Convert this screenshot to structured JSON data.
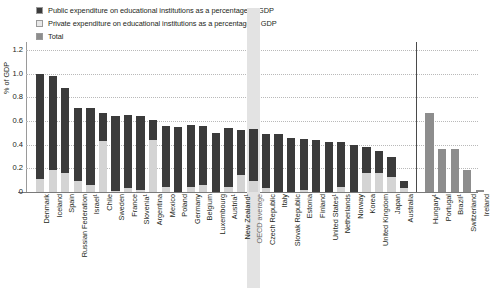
{
  "legend": {
    "items": [
      {
        "label": "Public expenditure on educational institutions as a percentage of GDP",
        "swatch": "dark-gray-swatch",
        "color": "#3b3b3b"
      },
      {
        "label": "Private expenditure on educational institutions as a percentage of GDP",
        "swatch": "light-gray-swatch",
        "color": "#d4d4d4"
      },
      {
        "label": "Total",
        "swatch": "medium-gray-swatch",
        "color": "#8d8d8d"
      }
    ]
  },
  "chart_data": {
    "type": "bar",
    "title": "",
    "subtitle": "",
    "xlabel": "",
    "ylabel": "% of GDP",
    "ylim": [
      0,
      1.2
    ],
    "ytick_labels": [
      "1.2",
      "1.0",
      "0.8",
      "0.6",
      "0.4",
      "0.2",
      "0"
    ],
    "ytick_values": [
      1.2,
      1.0,
      0.8,
      0.6,
      0.4,
      0.2,
      0
    ],
    "grid": true,
    "stacked": true,
    "legend_position": "top-left",
    "highlight_category": "OECD average",
    "panel_divider_after": "Australia",
    "categories": [
      "Denmark",
      "Iceland",
      "Spain",
      "Russian Federation",
      "Israel¹",
      "Chile",
      "Sweden",
      "France",
      "Slovenia¹",
      "Argentina",
      "Mexico",
      "Poland",
      "Germany",
      "Belgium",
      "Luxembourg",
      "Austria¹",
      "New Zealand¹",
      "OECD average",
      "Czech Republic",
      "Italy",
      "Slovak Republic",
      "Estonia",
      "Finland",
      "United States¹",
      "Netherlands",
      "Norway",
      "Korea",
      "United Kingdom",
      "Japan",
      "Australia",
      "Hungary¹",
      "Portugal",
      "Brazil¹",
      "Switzerland",
      "Ireland"
    ],
    "series": [
      {
        "name": "Public expenditure on educational institutions as a percentage of GDP",
        "color": "#3b3b3b",
        "values": [
          0.89,
          0.79,
          0.72,
          0.62,
          0.65,
          0.24,
          0.63,
          0.62,
          0.62,
          0.17,
          0.52,
          0.55,
          0.53,
          0.5,
          0.5,
          0.5,
          0.38,
          0.44,
          0.46,
          0.49,
          0.46,
          0.43,
          0.44,
          0.42,
          0.38,
          0.4,
          0.22,
          0.19,
          0.17,
          0.06,
          null,
          null,
          null,
          null,
          null
        ]
      },
      {
        "name": "Private expenditure on educational institutions as a percentage of GDP",
        "color": "#d4d4d4",
        "values": [
          0.11,
          0.19,
          0.16,
          0.09,
          0.06,
          0.43,
          0.01,
          0.03,
          0.02,
          0.44,
          0.04,
          0.0,
          0.04,
          0.06,
          0.0,
          0.04,
          0.14,
          0.09,
          0.03,
          0.0,
          0.0,
          0.02,
          0.0,
          0.0,
          0.04,
          0.0,
          0.16,
          0.16,
          0.13,
          0.03,
          null,
          null,
          null,
          null,
          null
        ]
      },
      {
        "name": "Total",
        "color": "#8d8d8d",
        "values": [
          null,
          null,
          null,
          null,
          null,
          null,
          null,
          null,
          null,
          null,
          null,
          null,
          null,
          null,
          null,
          null,
          null,
          null,
          null,
          null,
          null,
          null,
          null,
          null,
          null,
          null,
          null,
          null,
          null,
          null,
          0.67,
          0.36,
          0.36,
          0.19,
          0.02
        ]
      }
    ],
    "totals": [
      1.0,
      0.98,
      0.88,
      0.71,
      0.71,
      0.67,
      0.64,
      0.65,
      0.64,
      0.61,
      0.56,
      0.55,
      0.57,
      0.56,
      0.5,
      0.54,
      0.52,
      0.53,
      0.49,
      0.49,
      0.46,
      0.45,
      0.44,
      0.42,
      0.42,
      0.4,
      0.38,
      0.35,
      0.3,
      0.09,
      0.67,
      0.36,
      0.36,
      0.19,
      0.02
    ]
  }
}
